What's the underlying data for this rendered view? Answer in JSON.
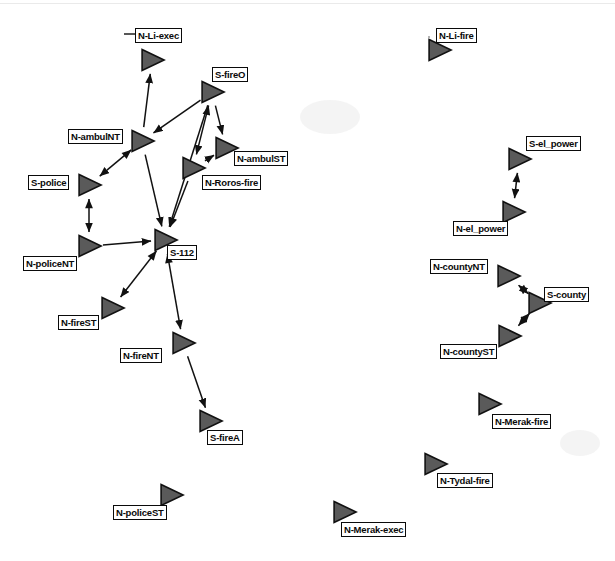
{
  "diagram": {
    "background_color": "#ffffff",
    "node_fill_color": "#5a5a5a",
    "node_stroke_color": "#111111",
    "edge_color": "#111111",
    "label_text_color": "#0a0a0a",
    "label_border_color": "#0a0a0a",
    "node_glyph": "right-pointing-triangle",
    "node_count": 20,
    "edge_count": 18
  },
  "nodes": [
    {
      "id": "N-Li-exec",
      "label": "N-Li-exec",
      "x": 152,
      "y": 60,
      "label_x": 135,
      "label_y": 28,
      "label_anchor": "above"
    },
    {
      "id": "S-fireO",
      "label": "S-fireO",
      "x": 212,
      "y": 92,
      "label_x": 212,
      "label_y": 67,
      "label_anchor": "above"
    },
    {
      "id": "N-ambulNT",
      "label": "N-ambulNT",
      "x": 142,
      "y": 141,
      "label_x": 68,
      "label_y": 129,
      "label_anchor": "left"
    },
    {
      "id": "N-ambulST",
      "label": "N-ambulST",
      "x": 226,
      "y": 148,
      "label_x": 234,
      "label_y": 151,
      "label_anchor": "right"
    },
    {
      "id": "N-Roros-fire",
      "label": "N-Roros-fire",
      "x": 193,
      "y": 168,
      "label_x": 202,
      "label_y": 175,
      "label_anchor": "right"
    },
    {
      "id": "S-police",
      "label": "S-police",
      "x": 89,
      "y": 185,
      "label_x": 28,
      "label_y": 175,
      "label_anchor": "left"
    },
    {
      "id": "N-policeNT",
      "label": "N-policeNT",
      "x": 89,
      "y": 246,
      "label_x": 23,
      "label_y": 256,
      "label_anchor": "below-left"
    },
    {
      "id": "S-112",
      "label": "S-112",
      "x": 165,
      "y": 240,
      "label_x": 167,
      "label_y": 245,
      "label_anchor": "right"
    },
    {
      "id": "N-fireST",
      "label": "N-fireST",
      "x": 112,
      "y": 308,
      "label_x": 58,
      "label_y": 315,
      "label_anchor": "below-left"
    },
    {
      "id": "N-fireNT",
      "label": "N-fireNT",
      "x": 183,
      "y": 343,
      "label_x": 120,
      "label_y": 348,
      "label_anchor": "left"
    },
    {
      "id": "S-fireA",
      "label": "S-fireA",
      "x": 210,
      "y": 421,
      "label_x": 207,
      "label_y": 430,
      "label_anchor": "below"
    },
    {
      "id": "N-policeST",
      "label": "N-policeST",
      "x": 171,
      "y": 495,
      "label_x": 113,
      "label_y": 505,
      "label_anchor": "below-left"
    },
    {
      "id": "N-Li-fire",
      "label": "N-Li-fire",
      "x": 439,
      "y": 50,
      "label_x": 436,
      "label_y": 28,
      "label_anchor": "above"
    },
    {
      "id": "S-el_power",
      "label": "S-el_power",
      "x": 519,
      "y": 159,
      "label_x": 526,
      "label_y": 136,
      "label_anchor": "above"
    },
    {
      "id": "N-el_power",
      "label": "N-el_power",
      "x": 513,
      "y": 212,
      "label_x": 453,
      "label_y": 221,
      "label_anchor": "below-left"
    },
    {
      "id": "N-countyNT",
      "label": "N-countyNT",
      "x": 508,
      "y": 276,
      "label_x": 430,
      "label_y": 259,
      "label_anchor": "left"
    },
    {
      "id": "S-county",
      "label": "S-county",
      "x": 539,
      "y": 303,
      "label_x": 544,
      "label_y": 287,
      "label_anchor": "right"
    },
    {
      "id": "N-countyST",
      "label": "N-countyST",
      "x": 509,
      "y": 336,
      "label_x": 440,
      "label_y": 344,
      "label_anchor": "below-left"
    },
    {
      "id": "N-Merak-fire",
      "label": "N-Merak-fire",
      "x": 489,
      "y": 404,
      "label_x": 492,
      "label_y": 414,
      "label_anchor": "below"
    },
    {
      "id": "N-Tydal-fire",
      "label": "N-Tydal-fire",
      "x": 435,
      "y": 464,
      "label_x": 437,
      "label_y": 473,
      "label_anchor": "below"
    },
    {
      "id": "N-Merak-exec",
      "label": "N-Merak-exec",
      "x": 344,
      "y": 512,
      "label_x": 341,
      "label_y": 522,
      "label_anchor": "below"
    }
  ],
  "edges": [
    {
      "from": "N-ambulNT",
      "to": "N-Li-exec",
      "direction": "forward"
    },
    {
      "from": "S-fireO",
      "to": "N-ambulNT",
      "direction": "forward"
    },
    {
      "from": "S-fireO",
      "to": "N-Roros-fire",
      "direction": "both"
    },
    {
      "from": "S-fireO",
      "to": "N-ambulST",
      "direction": "forward"
    },
    {
      "from": "N-Roros-fire",
      "to": "N-ambulST",
      "direction": "forward"
    },
    {
      "from": "N-ambulNT",
      "to": "S-police",
      "direction": "both"
    },
    {
      "from": "N-ambulNT",
      "to": "S-112",
      "direction": "forward"
    },
    {
      "from": "S-police",
      "to": "N-policeNT",
      "direction": "both"
    },
    {
      "from": "N-policeNT",
      "to": "S-112",
      "direction": "forward"
    },
    {
      "from": "N-Roros-fire",
      "to": "S-112",
      "direction": "forward"
    },
    {
      "from": "S-fireO",
      "to": "S-112",
      "direction": "forward"
    },
    {
      "from": "S-112",
      "to": "N-fireST",
      "direction": "both"
    },
    {
      "from": "S-112",
      "to": "N-fireNT",
      "direction": "both"
    },
    {
      "from": "N-fireNT",
      "to": "S-fireA",
      "direction": "forward"
    },
    {
      "from": "S-el_power",
      "to": "N-el_power",
      "direction": "both"
    },
    {
      "from": "S-county",
      "to": "N-countyNT",
      "direction": "both"
    },
    {
      "from": "S-county",
      "to": "N-countyST",
      "direction": "both"
    }
  ],
  "isolated_nodes": [
    "N-policeST",
    "N-Li-fire",
    "N-Merak-fire",
    "N-Tydal-fire",
    "N-Merak-exec"
  ]
}
